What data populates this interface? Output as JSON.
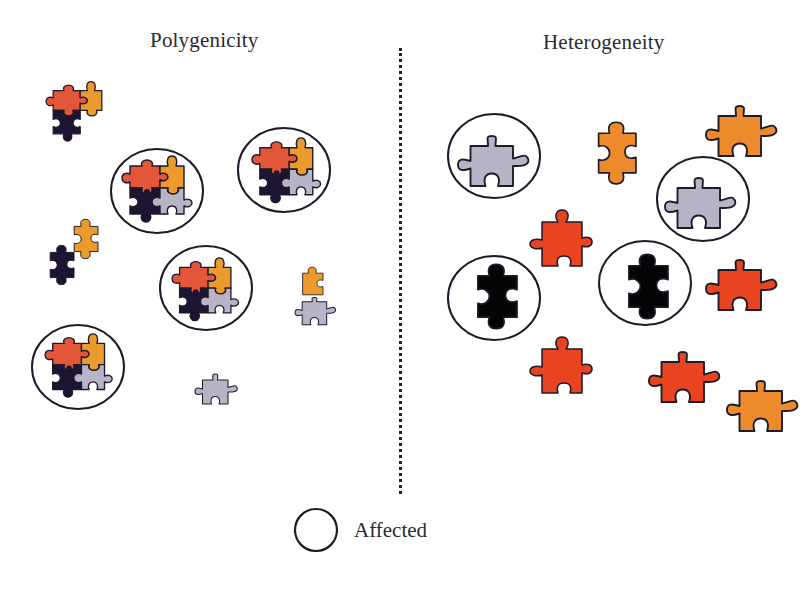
{
  "panels": {
    "left": {
      "title": "Polygenicity"
    },
    "right": {
      "title": "Heterogeneity"
    }
  },
  "legend": {
    "symbol": "circle",
    "label": "Affected"
  },
  "colors": {
    "red": "#e2573a",
    "orange": "#eb9a2e",
    "black": "#1c1430",
    "grey": "#b8b4c8",
    "outline": "#1e1a2a",
    "het_orange": "#ec8a2c",
    "het_red": "#e8441f",
    "het_black": "#050505"
  },
  "polygenicity_groups": [
    {
      "affected": false,
      "pieces": [
        "red",
        "orange",
        "black"
      ]
    },
    {
      "affected": true,
      "pieces": [
        "red",
        "orange",
        "black",
        "grey"
      ]
    },
    {
      "affected": true,
      "pieces": [
        "red",
        "orange",
        "black",
        "grey"
      ]
    },
    {
      "affected": false,
      "pieces": [
        "orange",
        "black"
      ]
    },
    {
      "affected": true,
      "pieces": [
        "red",
        "orange",
        "black",
        "grey"
      ]
    },
    {
      "affected": false,
      "pieces": [
        "orange",
        "grey"
      ]
    },
    {
      "affected": true,
      "pieces": [
        "red",
        "orange",
        "black",
        "grey"
      ]
    },
    {
      "affected": false,
      "pieces": [
        "grey"
      ]
    }
  ],
  "heterogeneity_pieces": [
    {
      "affected": true,
      "color": "grey"
    },
    {
      "affected": false,
      "color": "orange"
    },
    {
      "affected": false,
      "color": "orange"
    },
    {
      "affected": true,
      "color": "grey"
    },
    {
      "affected": false,
      "color": "red"
    },
    {
      "affected": true,
      "color": "black"
    },
    {
      "affected": true,
      "color": "black"
    },
    {
      "affected": false,
      "color": "red"
    },
    {
      "affected": false,
      "color": "red"
    },
    {
      "affected": false,
      "color": "red"
    },
    {
      "affected": false,
      "color": "orange"
    }
  ]
}
